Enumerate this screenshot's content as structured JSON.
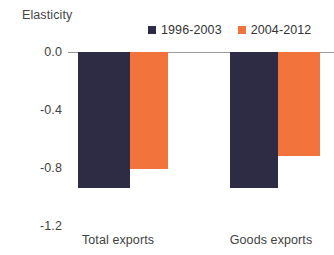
{
  "chart_data": {
    "type": "bar",
    "title": "",
    "ylabel": "Elasticity",
    "xlabel": "",
    "categories": [
      "Total exports",
      "Goods exports"
    ],
    "series": [
      {
        "name": "1996-2003",
        "values": [
          -0.94,
          -0.94
        ],
        "color": "#2e2b45"
      },
      {
        "name": "2004-2012",
        "values": [
          -0.81,
          -0.72
        ],
        "color": "#f2743c"
      }
    ],
    "ylim": [
      -1.2,
      0.0
    ],
    "yticks": [
      0.0,
      -0.4,
      -0.8,
      -1.2
    ],
    "ytick_labels": [
      "0.0",
      "-0.4",
      "-0.8",
      "-1.2"
    ],
    "grid": false,
    "legend_position": "top-right",
    "zero_line_color": "#9a9a9a",
    "background": "#ffffff"
  },
  "axis": {
    "y_title": "Elasticity",
    "tick_0": "0.0",
    "tick_1": "-0.4",
    "tick_2": "-0.8",
    "tick_3": "-1.2"
  },
  "legend": {
    "entry_0_label": "1996-2003",
    "entry_1_label": "2004-2012"
  },
  "categories": {
    "cat_0": "Total exports",
    "cat_1": "Goods exports"
  }
}
